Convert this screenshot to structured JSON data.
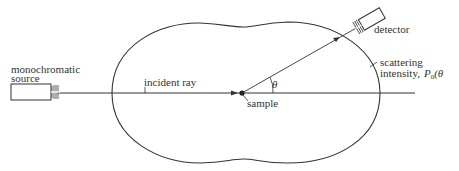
{
  "diagram": {
    "type": "scattering-experiment",
    "labels": {
      "source_line1": "monochromatic",
      "source_line2": "source",
      "incident_ray": "incident ray",
      "sample": "sample",
      "angle": "θ",
      "detector": "detector",
      "intensity_line1": "scattering",
      "intensity_line2": "intensity,",
      "intensity_symbol": "P",
      "intensity_subscript": "0",
      "intensity_arg": "(θ"
    },
    "colors": {
      "line": "#333333",
      "background": "#ffffff"
    }
  }
}
